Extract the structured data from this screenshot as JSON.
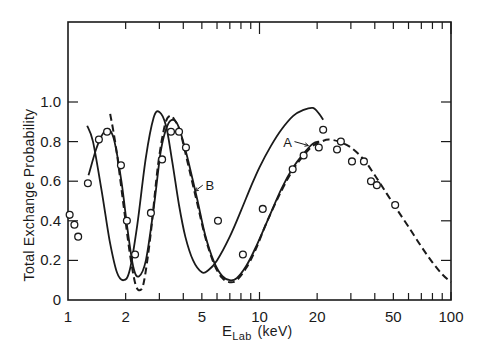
{
  "chart_data": {
    "type": "line",
    "title": "",
    "xlabel": "E_Lab (keV)",
    "xlabel_main": "E",
    "xlabel_sub": "Lab",
    "xlabel_unit": "(keV)",
    "ylabel": "Total Exchange Probability",
    "xscale": "log",
    "xlim": [
      1,
      100
    ],
    "ylim": [
      0,
      1.4
    ],
    "x_tick_labels": [
      {
        "value": 1,
        "label": "1"
      },
      {
        "value": 2,
        "label": "2"
      },
      {
        "value": 5,
        "label": "5"
      },
      {
        "value": 10,
        "label": "10"
      },
      {
        "value": 20,
        "label": "20"
      },
      {
        "value": 50,
        "label": "50"
      },
      {
        "value": 100,
        "label": "100"
      }
    ],
    "y_tick_labels": [
      {
        "value": 0,
        "label": "0"
      },
      {
        "value": 0.2,
        "label": "0.2"
      },
      {
        "value": 0.4,
        "label": "0.4"
      },
      {
        "value": 0.6,
        "label": "0.6"
      },
      {
        "value": 0.8,
        "label": "0.8"
      },
      {
        "value": 1.0,
        "label": "1.0"
      }
    ],
    "grid": false,
    "legend": "none (curves labeled inline with arrows A and B)",
    "annotations": [
      {
        "text": "A",
        "x": 14.0,
        "y": 0.8,
        "arrow_to": [
          18.0,
          0.78
        ]
      },
      {
        "text": "B",
        "x": 5.5,
        "y": 0.58,
        "arrow_to": [
          4.6,
          0.55
        ]
      }
    ],
    "series": [
      {
        "name": "A",
        "style": "solid",
        "x": [
          1.26,
          1.35,
          1.5,
          1.65,
          1.8,
          1.95,
          2.1,
          2.3,
          2.55,
          2.8,
          3.0,
          3.25,
          3.5,
          3.8,
          4.1,
          4.5,
          5.0,
          5.4,
          6.0,
          7.0,
          8.0,
          9.0,
          10.0,
          11.5,
          13.0,
          15.0,
          17.0,
          19.0,
          20.5,
          21.5
        ],
        "y": [
          0.88,
          0.8,
          0.55,
          0.3,
          0.14,
          0.1,
          0.15,
          0.38,
          0.72,
          0.92,
          0.95,
          0.88,
          0.7,
          0.48,
          0.32,
          0.2,
          0.14,
          0.15,
          0.2,
          0.32,
          0.45,
          0.57,
          0.67,
          0.78,
          0.86,
          0.93,
          0.96,
          0.97,
          0.94,
          0.91
        ]
      },
      {
        "name": "B",
        "style": "solid",
        "x": [
          1.28,
          1.4,
          1.5,
          1.58,
          1.65,
          1.75,
          1.9,
          2.05,
          2.2,
          2.35,
          2.55,
          2.8,
          3.05,
          3.3,
          3.55,
          3.8,
          4.2,
          4.7,
          5.2,
          5.8,
          6.4,
          7.0,
          7.6,
          8.5,
          9.5,
          11.0,
          13.0,
          15.0,
          17.0,
          19.0,
          20.5
        ],
        "y": [
          0.63,
          0.76,
          0.83,
          0.86,
          0.86,
          0.8,
          0.6,
          0.35,
          0.16,
          0.12,
          0.2,
          0.46,
          0.75,
          0.88,
          0.91,
          0.87,
          0.72,
          0.52,
          0.33,
          0.19,
          0.12,
          0.1,
          0.11,
          0.17,
          0.26,
          0.4,
          0.56,
          0.67,
          0.74,
          0.79,
          0.8
        ]
      },
      {
        "name": "dashed",
        "style": "dashed",
        "x": [
          1.66,
          1.72,
          1.8,
          1.95,
          2.1,
          2.25,
          2.38,
          2.5,
          2.7,
          2.95,
          3.2,
          3.4,
          3.6,
          3.85,
          4.2,
          4.7,
          5.2,
          5.8,
          6.4,
          7.0,
          7.6,
          8.5,
          9.5,
          11.0,
          13.0,
          15.0,
          17.0,
          19.0,
          21.0,
          23.0,
          26.0,
          30.0,
          35.0,
          40.0,
          46.0,
          52.0,
          60.0,
          70.0,
          80.0,
          90.0,
          100.0
        ],
        "y": [
          0.94,
          0.86,
          0.74,
          0.48,
          0.24,
          0.08,
          0.05,
          0.1,
          0.33,
          0.68,
          0.88,
          0.93,
          0.91,
          0.85,
          0.7,
          0.5,
          0.32,
          0.18,
          0.11,
          0.09,
          0.1,
          0.16,
          0.25,
          0.4,
          0.55,
          0.66,
          0.73,
          0.78,
          0.8,
          0.81,
          0.8,
          0.77,
          0.71,
          0.63,
          0.54,
          0.46,
          0.37,
          0.27,
          0.19,
          0.13,
          0.09
        ]
      },
      {
        "name": "experimental",
        "style": "open-circle markers",
        "x": [
          1.02,
          1.08,
          1.13,
          1.27,
          1.45,
          1.6,
          1.89,
          2.03,
          2.24,
          2.71,
          3.1,
          3.45,
          3.8,
          4.13,
          6.07,
          8.19,
          10.4,
          14.9,
          17.0,
          20.4,
          21.5,
          25.4,
          26.6,
          30.4,
          35.1,
          38.2,
          41.0,
          51.1
        ],
        "y": [
          0.43,
          0.38,
          0.32,
          0.59,
          0.81,
          0.85,
          0.68,
          0.4,
          0.23,
          0.44,
          0.71,
          0.85,
          0.85,
          0.77,
          0.4,
          0.23,
          0.46,
          0.66,
          0.73,
          0.77,
          0.86,
          0.76,
          0.8,
          0.7,
          0.7,
          0.6,
          0.58,
          0.48
        ]
      }
    ]
  }
}
